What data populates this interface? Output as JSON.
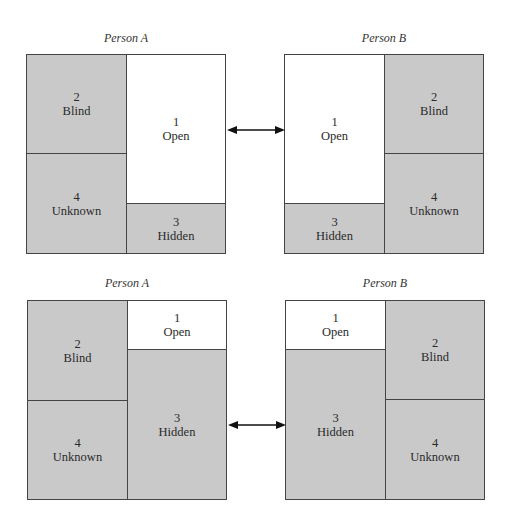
{
  "figure": {
    "top_row": {
      "person_a": {
        "title": "Person A",
        "panes": {
          "blind": {
            "number": "2",
            "label": "Blind"
          },
          "unknown": {
            "number": "4",
            "label": "Unknown"
          },
          "open": {
            "number": "1",
            "label": "Open"
          },
          "hidden": {
            "number": "3",
            "label": "Hidden"
          }
        }
      },
      "person_b": {
        "title": "Person B",
        "panes": {
          "open": {
            "number": "1",
            "label": "Open"
          },
          "hidden": {
            "number": "3",
            "label": "Hidden"
          },
          "blind": {
            "number": "2",
            "label": "Blind"
          },
          "unknown": {
            "number": "4",
            "label": "Unknown"
          }
        }
      },
      "arrow": "double-headed arrow connecting Open panes"
    },
    "bottom_row": {
      "person_a": {
        "title": "Person A",
        "panes": {
          "blind": {
            "number": "2",
            "label": "Blind"
          },
          "unknown": {
            "number": "4",
            "label": "Unknown"
          },
          "open": {
            "number": "1",
            "label": "Open"
          },
          "hidden": {
            "number": "3",
            "label": "Hidden"
          }
        }
      },
      "person_b": {
        "title": "Person B",
        "panes": {
          "open": {
            "number": "1",
            "label": "Open"
          },
          "hidden": {
            "number": "3",
            "label": "Hidden"
          },
          "blind": {
            "number": "2",
            "label": "Blind"
          },
          "unknown": {
            "number": "4",
            "label": "Unknown"
          }
        }
      },
      "arrow": "double-headed arrow connecting Hidden panes"
    }
  },
  "colors": {
    "shaded": "#c9c9c9",
    "clear": "#ffffff",
    "line": "#444444"
  }
}
